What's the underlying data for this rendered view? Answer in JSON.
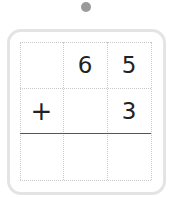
{
  "problem": {
    "rows": [
      [
        "",
        "6",
        "5"
      ],
      [
        "+",
        "",
        "3"
      ],
      [
        "",
        "",
        ""
      ]
    ],
    "operator": "+",
    "addend_top": "65",
    "addend_bottom": "3"
  },
  "colors": {
    "dot": "#9a9a9a",
    "frame_border": "#e4e4e4",
    "grid_dotted": "#c9c9c9",
    "sum_line": "#555555",
    "digits": "#222222"
  }
}
